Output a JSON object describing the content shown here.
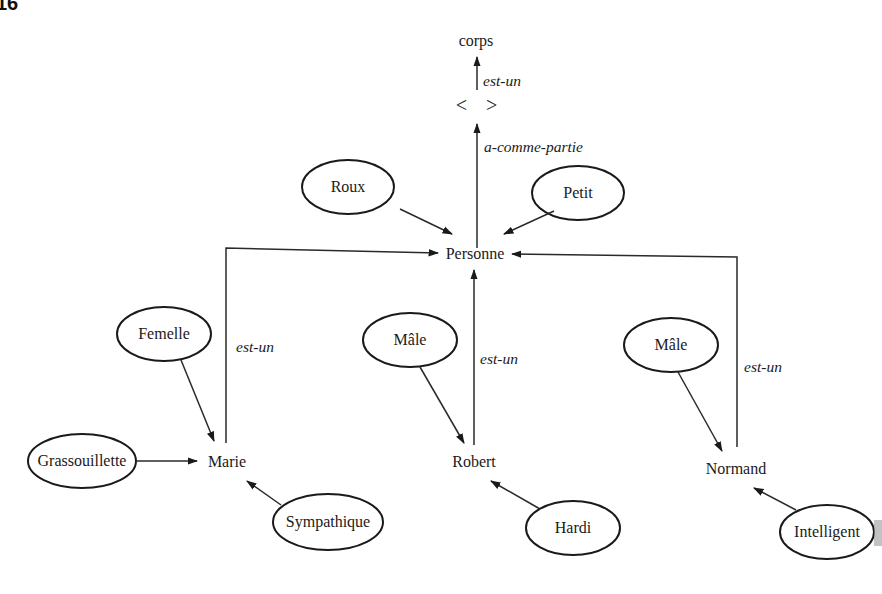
{
  "corner_mark": "16",
  "diagram": {
    "type": "semantic-network",
    "concepts": {
      "corps": "corps",
      "anonymous": "<   >",
      "personne": "Personne",
      "marie": "Marie",
      "robert": "Robert",
      "normand": "Normand"
    },
    "attributes": {
      "roux": "Roux",
      "petit": "Petit",
      "femelle": "Femelle",
      "grassouillette": "Grassouillette",
      "sympathique": "Sympathique",
      "male_robert": "Mâle",
      "hardi": "Hardi",
      "male_normand": "Mâle",
      "intelligent": "Intelligent"
    },
    "relations": {
      "anon_est_un_corps": "est-un",
      "personne_a_comme_partie": "a-comme-partie",
      "marie_est_un": "est-un",
      "robert_est_un": "est-un",
      "normand_est_un": "est-un"
    },
    "edges": [
      {
        "from": "anonymous",
        "to": "corps",
        "label": "est-un"
      },
      {
        "from": "personne",
        "to": "anonymous",
        "label": "a-comme-partie"
      },
      {
        "from": "Roux",
        "to": "Personne",
        "label": ""
      },
      {
        "from": "Petit",
        "to": "Personne",
        "label": ""
      },
      {
        "from": "Marie",
        "to": "Personne",
        "label": "est-un"
      },
      {
        "from": "Robert",
        "to": "Personne",
        "label": "est-un"
      },
      {
        "from": "Normand",
        "to": "Personne",
        "label": "est-un"
      },
      {
        "from": "Femelle",
        "to": "Marie",
        "label": ""
      },
      {
        "from": "Grassouillette",
        "to": "Marie",
        "label": ""
      },
      {
        "from": "Sympathique",
        "to": "Marie",
        "label": ""
      },
      {
        "from": "Mâle",
        "to": "Robert",
        "label": ""
      },
      {
        "from": "Hardi",
        "to": "Robert",
        "label": ""
      },
      {
        "from": "Mâle",
        "to": "Normand",
        "label": ""
      },
      {
        "from": "Intelligent",
        "to": "Normand",
        "label": ""
      }
    ]
  }
}
